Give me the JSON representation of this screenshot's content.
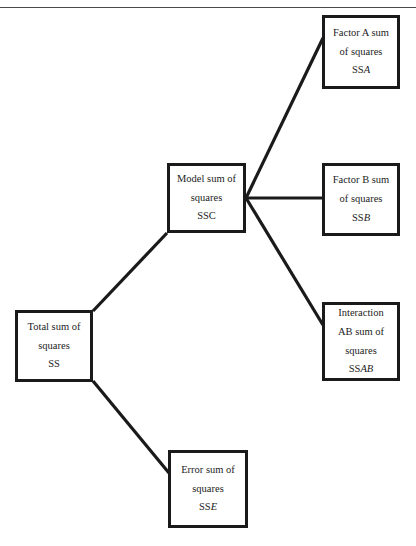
{
  "page": {
    "header_text": "",
    "width": 416,
    "height": 546,
    "background": "#ffffff",
    "line_color": "#1a1a1a",
    "text_color": "#1c1c1c"
  },
  "diagram": {
    "type": "tree",
    "nodes": {
      "total": {
        "name": "Total sum of squares",
        "lines": [
          "Total sum of",
          "squares"
        ],
        "symbol_prefix": "SS",
        "symbol_italic": ""
      },
      "model": {
        "name": "Model sum of squares",
        "lines": [
          "Model sum of",
          "squares"
        ],
        "symbol_prefix": "SS",
        "symbol_italic": "C"
      },
      "error": {
        "name": "Error sum of squares",
        "lines": [
          "Error sum of",
          "squares"
        ],
        "symbol_prefix": "SS",
        "symbol_italic": "E"
      },
      "factor_a": {
        "name": "Factor A sum of squares",
        "lines": [
          "Factor A sum",
          "of squares"
        ],
        "symbol_prefix": "SS",
        "symbol_italic": "A"
      },
      "factor_b": {
        "name": "Factor B sum of squares",
        "lines": [
          "Factor B sum",
          "of squares"
        ],
        "symbol_prefix": "SS",
        "symbol_italic": "B"
      },
      "interaction": {
        "name": "Interaction AB sum of squares",
        "lines": [
          "Interaction",
          "AB sum of",
          "squares"
        ],
        "symbol_prefix": "SS",
        "symbol_italic": "AB"
      }
    },
    "edges": [
      {
        "from": "total",
        "to": "model"
      },
      {
        "from": "total",
        "to": "error"
      },
      {
        "from": "model",
        "to": "factor_a"
      },
      {
        "from": "model",
        "to": "factor_b"
      },
      {
        "from": "model",
        "to": "interaction"
      }
    ]
  }
}
